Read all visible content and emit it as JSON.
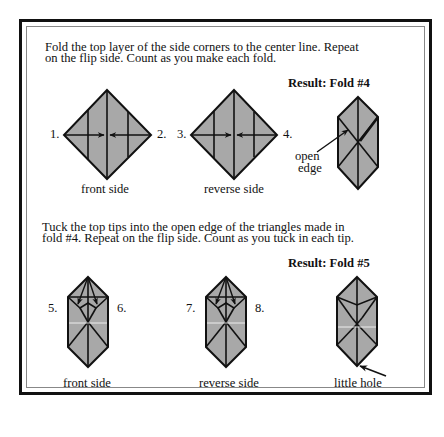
{
  "section1": {
    "instructions_line1": "Fold the top layer of the side corners to the center line. Repeat",
    "instructions_line2": "on the flip side. Count as you make each fold.",
    "result_label": "Result: Fold #4",
    "step_labels": [
      "1.",
      "2.",
      "3.",
      "4."
    ],
    "front_caption": "front side",
    "reverse_caption": "reverse side",
    "annotation_line1": "open",
    "annotation_line2": "edge"
  },
  "section2": {
    "instructions_line1": "Tuck the top tips into the open edge of the triangles made in",
    "instructions_line2": "fold #4. Repeat on the flip side. Count as you tuck in each tip.",
    "result_label": "Result: Fold #5",
    "step_labels": [
      "5.",
      "6.",
      "7.",
      "8."
    ],
    "front_caption": "front side",
    "reverse_caption": "reverse side",
    "annotation": "little hole"
  },
  "colors": {
    "paper_fill": "#a8a8a8",
    "line": "#111111",
    "border": "#111111"
  }
}
